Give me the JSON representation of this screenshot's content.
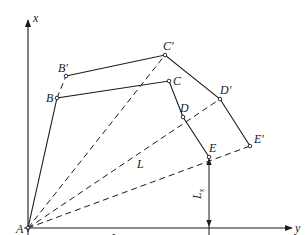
{
  "diagram": {
    "type": "geometric-displacement-diagram",
    "colors": {
      "stroke": "#1a1a1a",
      "background": "#ffffff"
    },
    "axes": {
      "x_label": "x",
      "y_label": "y",
      "origin_label": "A"
    },
    "points": {
      "A": "A",
      "B": "B",
      "B_prime": "B′",
      "C": "C",
      "C_prime": "C′",
      "D": "D",
      "D_prime": "D′",
      "E": "E",
      "E_prime": "E′"
    },
    "dimensions": {
      "L": "L",
      "Lx_main": "L",
      "Lx_sub": "x",
      "Ly_main": "L",
      "Ly_sub": "y"
    }
  }
}
